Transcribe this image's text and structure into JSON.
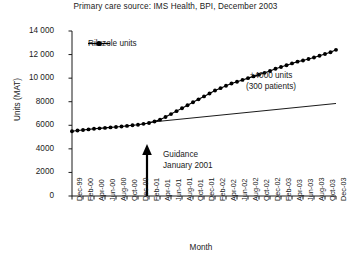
{
  "chart_data": {
    "type": "line",
    "title": "Primary care source: IMS Health, BPI, December 2003",
    "xlabel": "Month",
    "ylabel": "Units (MAT)",
    "ylim": [
      0,
      14000
    ],
    "ytick_labels": [
      "14 000",
      "12 000",
      "10 000",
      "8000",
      "6000",
      "4000",
      "2000",
      "0"
    ],
    "ytick_values": [
      14000,
      12000,
      10000,
      8000,
      6000,
      4000,
      2000,
      0
    ],
    "grid": false,
    "legend_position": "top-left",
    "series": [
      {
        "name": "Riluzole units",
        "marker": "filled-circle",
        "color": "#000000",
        "x": [
          "Dec-99",
          "Jan-00",
          "Feb-00",
          "Mar-00",
          "Apr-00",
          "May-00",
          "Jun-00",
          "Jul-00",
          "Aug-00",
          "Sep-00",
          "Oct-00",
          "Nov-00",
          "Dec-00",
          "Jan-01",
          "Feb-01",
          "Mar-01",
          "Apr-01",
          "May-01",
          "Jun-01",
          "Jul-01",
          "Aug-01",
          "Sep-01",
          "Oct-01",
          "Nov-01",
          "Dec-01",
          "Jan-02",
          "Feb-02",
          "Mar-02",
          "Apr-02",
          "May-02",
          "Jun-02",
          "Jul-02",
          "Aug-02",
          "Sep-02",
          "Oct-02",
          "Nov-02",
          "Dec-02",
          "Jan-03",
          "Feb-03",
          "Mar-03",
          "Apr-03",
          "May-03",
          "Jun-03",
          "Jul-03",
          "Aug-03",
          "Sep-03",
          "Oct-03",
          "Nov-03",
          "Dec-03"
        ],
        "values": [
          5500,
          5560,
          5600,
          5650,
          5700,
          5740,
          5780,
          5820,
          5860,
          5900,
          5950,
          6000,
          6050,
          6120,
          6200,
          6320,
          6480,
          6700,
          6950,
          7200,
          7450,
          7700,
          7950,
          8200,
          8450,
          8700,
          8950,
          9150,
          9350,
          9550,
          9700,
          9850,
          10000,
          10150,
          10300,
          10450,
          10600,
          10800,
          10950,
          11100,
          11250,
          11400,
          11500,
          11620,
          11750,
          11900,
          12050,
          12200,
          12400
        ]
      },
      {
        "name": "Baseline trend",
        "marker": "none",
        "color": "#000000",
        "x": [
          "Feb-01",
          "Dec-03"
        ],
        "values": [
          6250,
          7850
        ]
      }
    ],
    "annotations": [
      {
        "name": "guidance",
        "line1": "Guidance",
        "line2": "January 2001",
        "arrow_at_x": "Jan-01"
      },
      {
        "name": "units-delta",
        "line1": "+4000 units",
        "line2": "(300 patients)"
      }
    ]
  },
  "legend": {
    "entries": [
      {
        "label": "Riluzole units"
      }
    ]
  },
  "xtick_labels": [
    "Dec-99",
    "Feb-00",
    "Apr-00",
    "Jun-00",
    "Aug-00",
    "Oct-00",
    "Dec-00",
    "Feb-01",
    "Apr-01",
    "Jun-01",
    "Aug-01",
    "Oct-01",
    "Dec-01",
    "Feb-02",
    "Apr-02",
    "Jun-02",
    "Aug-02",
    "Oct-02",
    "Dec-02",
    "Feb-03",
    "Apr-03",
    "Jun-03",
    "Aug-03",
    "Oct-03",
    "Dec-03"
  ]
}
